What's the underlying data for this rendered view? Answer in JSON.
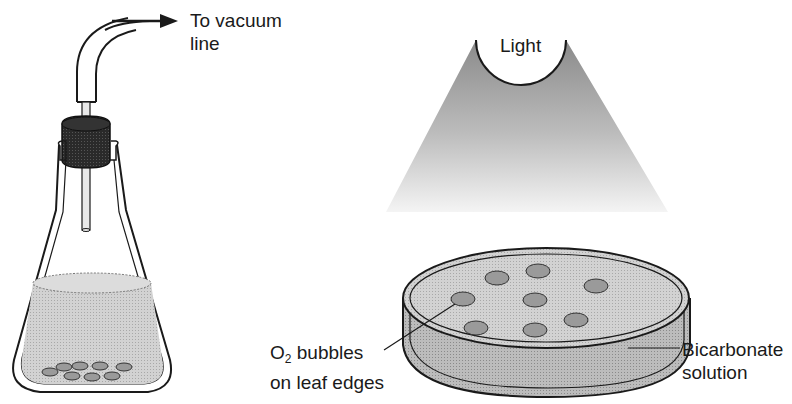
{
  "diagram": {
    "type": "photosynthesis-leaf-disk-assay",
    "colors": {
      "line": "#1a1a1a",
      "stopper": "#2a2a2a",
      "liquid": "#cfcfcf",
      "leaf_disk": "#9a9a9a",
      "light_cone_top": "#8a8a8a",
      "light_cone_bottom": "#f2f2f2",
      "background": "#ffffff"
    },
    "left_panel": {
      "name": "vacuum-flask",
      "labels": {
        "vacuum_line_1": "To vacuum",
        "vacuum_line_2": "line"
      },
      "leaf_disk_count": 9
    },
    "right_panel": {
      "name": "petri-dish-under-light",
      "labels": {
        "light": "Light",
        "o2_prefix": "O",
        "o2_sub": "2",
        "o2_line_1_rest": " bubbles",
        "o2_line_2": "on leaf edges",
        "bicarb_line_1": "Bicarbonate",
        "bicarb_line_2": "solution"
      },
      "leaf_disk_count": 8
    }
  }
}
